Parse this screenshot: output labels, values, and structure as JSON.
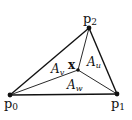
{
  "diagram": {
    "title": "",
    "vertices": [
      {
        "id": "p0",
        "label": "p",
        "sub": "0",
        "x": 10,
        "y": 95
      },
      {
        "id": "p1",
        "label": "p",
        "sub": "1",
        "x": 117,
        "y": 94
      },
      {
        "id": "p2",
        "label": "p",
        "sub": "2",
        "x": 89,
        "y": 28
      }
    ],
    "interior_point": {
      "id": "x",
      "label": "x",
      "x": 78,
      "y": 70
    },
    "areas": [
      {
        "id": "Au",
        "label": "A",
        "sub": "u"
      },
      {
        "id": "Av",
        "label": "A",
        "sub": "v"
      },
      {
        "id": "Aw",
        "label": "A",
        "sub": "w"
      }
    ],
    "line_color": "#111111"
  }
}
